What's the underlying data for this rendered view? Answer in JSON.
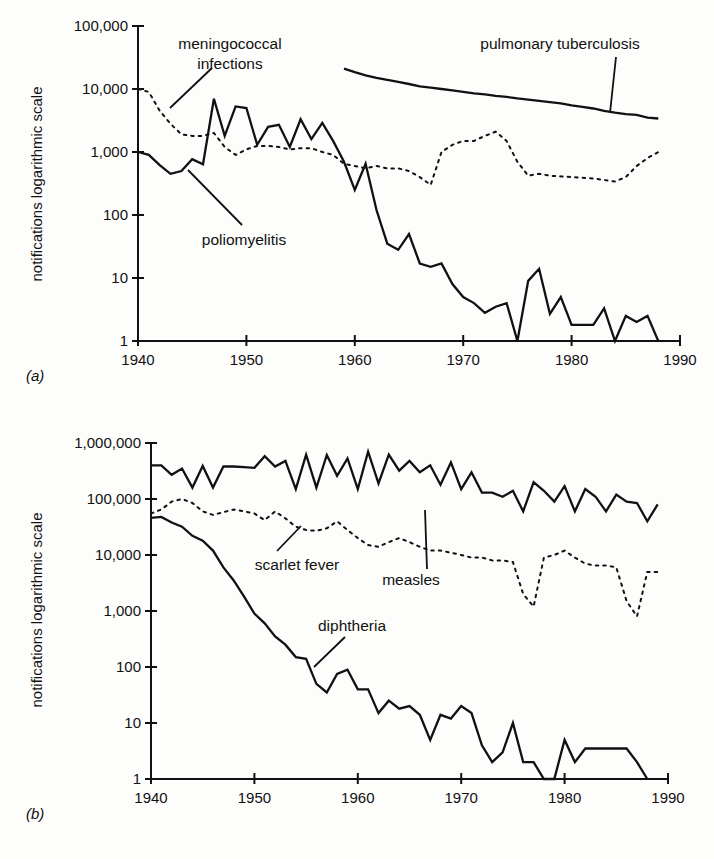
{
  "chart_data": [
    {
      "panel": "(a)",
      "type": "line",
      "title": "",
      "xlabel": "",
      "ylabel": "notifications logarithmic scale",
      "yscale": "log",
      "ylim": [
        1,
        100000
      ],
      "xlim": [
        1940,
        1990
      ],
      "xticks": [
        1940,
        1950,
        1960,
        1970,
        1980,
        1990
      ],
      "xtick_labels": [
        "1940",
        "1950",
        "1960",
        "1970",
        "1980",
        "1990"
      ],
      "yticks": [
        1,
        10,
        100,
        1000,
        10000,
        100000
      ],
      "ytick_labels": [
        "1",
        "10",
        "100",
        "1,000",
        "10,000",
        "100,000"
      ],
      "grid": false,
      "legend": "inline labels with leader lines",
      "series": [
        {
          "name": "poliomyelitis",
          "style": "solid",
          "x": [
            1940,
            1941,
            1942,
            1943,
            1944,
            1945,
            1946,
            1947,
            1948,
            1949,
            1950,
            1951,
            1952,
            1953,
            1954,
            1955,
            1956,
            1957,
            1958,
            1959,
            1960,
            1961,
            1962,
            1963,
            1964,
            1965,
            1966,
            1967,
            1968,
            1969,
            1970,
            1971,
            1972,
            1973,
            1974,
            1975,
            1976,
            1977,
            1978,
            1979,
            1980,
            1981,
            1982,
            1983,
            1984,
            1985,
            1986,
            1987,
            1988
          ],
          "values": [
            1000,
            900,
            620,
            450,
            500,
            770,
            640,
            7000,
            1800,
            5300,
            5000,
            1300,
            2500,
            2700,
            1200,
            3300,
            1600,
            2900,
            1500,
            700,
            250,
            650,
            120,
            35,
            28,
            50,
            17,
            15,
            17,
            8,
            5,
            4,
            2.8,
            3.5,
            4,
            1,
            9,
            14,
            2.7,
            5,
            1.8,
            1.8,
            1.8,
            3.3,
            1,
            2.5,
            2,
            2.5,
            1
          ]
        },
        {
          "name": "meningococcal infections",
          "style": "dotted",
          "x": [
            1940,
            1941,
            1942,
            1943,
            1944,
            1945,
            1946,
            1947,
            1948,
            1949,
            1950,
            1951,
            1952,
            1953,
            1954,
            1955,
            1956,
            1957,
            1958,
            1959,
            1960,
            1961,
            1962,
            1963,
            1964,
            1965,
            1966,
            1967,
            1968,
            1969,
            1970,
            1971,
            1972,
            1973,
            1974,
            1975,
            1976,
            1977,
            1978,
            1979,
            1980,
            1981,
            1982,
            1983,
            1984,
            1985,
            1986,
            1987,
            1988
          ],
          "values": [
            10000,
            9000,
            4500,
            2800,
            1900,
            1800,
            1800,
            2000,
            1200,
            900,
            1100,
            1250,
            1250,
            1200,
            1100,
            1150,
            1150,
            1000,
            900,
            650,
            600,
            550,
            600,
            550,
            550,
            500,
            400,
            300,
            1000,
            1300,
            1500,
            1500,
            1800,
            2100,
            1500,
            700,
            420,
            450,
            420,
            410,
            400,
            390,
            380,
            360,
            340,
            400,
            600,
            800,
            1000
          ]
        },
        {
          "name": "pulmonary tuberculosis",
          "style": "solid",
          "x": [
            1959,
            1960,
            1961,
            1962,
            1963,
            1964,
            1965,
            1966,
            1967,
            1968,
            1969,
            1970,
            1971,
            1972,
            1973,
            1974,
            1975,
            1976,
            1977,
            1978,
            1979,
            1980,
            1981,
            1982,
            1983,
            1984,
            1985,
            1986,
            1987,
            1988
          ],
          "values": [
            21000,
            18500,
            16500,
            15000,
            14000,
            13000,
            12000,
            11000,
            10500,
            10000,
            9500,
            9000,
            8500,
            8200,
            7800,
            7500,
            7100,
            6800,
            6500,
            6200,
            5900,
            5500,
            5200,
            4900,
            4500,
            4200,
            4000,
            3900,
            3500,
            3400
          ]
        }
      ],
      "annotations": [
        "meningococcal infections",
        "pulmonary tuberculosis",
        "poliomyelitis"
      ]
    },
    {
      "panel": "(b)",
      "type": "line",
      "title": "",
      "xlabel": "",
      "ylabel": "notifications logarithmic scale",
      "yscale": "log",
      "ylim": [
        1,
        1000000
      ],
      "xlim": [
        1940,
        1990
      ],
      "xticks": [
        1940,
        1950,
        1960,
        1970,
        1980,
        1990
      ],
      "xtick_labels": [
        "1940",
        "1950",
        "1960",
        "1970",
        "1980",
        "1990"
      ],
      "yticks": [
        1,
        10,
        100,
        1000,
        10000,
        100000,
        1000000
      ],
      "ytick_labels": [
        "1",
        "10",
        "100",
        "1,000",
        "10,000",
        "100,000",
        "1,000,000"
      ],
      "grid": false,
      "legend": "inline labels with leader lines",
      "series": [
        {
          "name": "measles",
          "style": "solid",
          "x": [
            1940,
            1941,
            1942,
            1943,
            1944,
            1945,
            1946,
            1947,
            1948,
            1949,
            1950,
            1951,
            1952,
            1953,
            1954,
            1955,
            1956,
            1957,
            1958,
            1959,
            1960,
            1961,
            1962,
            1963,
            1964,
            1965,
            1966,
            1967,
            1968,
            1969,
            1970,
            1971,
            1972,
            1973,
            1974,
            1975,
            1976,
            1977,
            1978,
            1979,
            1980,
            1981,
            1982,
            1983,
            1984,
            1985,
            1986,
            1987,
            1988,
            1989
          ],
          "values": [
            400000,
            400000,
            270000,
            350000,
            160000,
            390000,
            160000,
            380000,
            380000,
            370000,
            360000,
            580000,
            380000,
            480000,
            150000,
            620000,
            160000,
            610000,
            260000,
            530000,
            150000,
            700000,
            190000,
            620000,
            320000,
            480000,
            300000,
            400000,
            180000,
            450000,
            150000,
            300000,
            130000,
            130000,
            110000,
            140000,
            60000,
            200000,
            140000,
            90000,
            170000,
            60000,
            150000,
            110000,
            60000,
            120000,
            90000,
            85000,
            40000,
            80000
          ]
        },
        {
          "name": "scarlet fever",
          "style": "dotted",
          "x": [
            1940,
            1941,
            1942,
            1943,
            1944,
            1945,
            1946,
            1947,
            1948,
            1949,
            1950,
            1951,
            1952,
            1953,
            1954,
            1955,
            1956,
            1957,
            1958,
            1959,
            1960,
            1961,
            1962,
            1963,
            1964,
            1965,
            1966,
            1967,
            1968,
            1969,
            1970,
            1971,
            1972,
            1973,
            1974,
            1975,
            1976,
            1977,
            1978,
            1979,
            1980,
            1981,
            1982,
            1983,
            1984,
            1985,
            1986,
            1987,
            1988,
            1989
          ],
          "values": [
            55000,
            65000,
            90000,
            100000,
            85000,
            60000,
            52000,
            58000,
            65000,
            60000,
            55000,
            42000,
            60000,
            45000,
            32000,
            28000,
            27000,
            30000,
            40000,
            28000,
            20000,
            15000,
            14000,
            17000,
            20000,
            17000,
            14000,
            12000,
            12000,
            11000,
            10000,
            9000,
            9000,
            8000,
            8000,
            7500,
            2000,
            1200,
            9000,
            10000,
            12000,
            9000,
            7000,
            6500,
            6500,
            6000,
            1500,
            800,
            5000,
            5000
          ]
        },
        {
          "name": "diphtheria",
          "style": "solid",
          "x": [
            1940,
            1941,
            1942,
            1943,
            1944,
            1945,
            1946,
            1947,
            1948,
            1949,
            1950,
            1951,
            1952,
            1953,
            1954,
            1955,
            1956,
            1957,
            1958,
            1959,
            1960,
            1961,
            1962,
            1963,
            1964,
            1965,
            1966,
            1967,
            1968,
            1969,
            1970,
            1971,
            1972,
            1973,
            1974,
            1975,
            1976,
            1977,
            1978,
            1979,
            1980,
            1981,
            1982,
            1983,
            1984,
            1985,
            1986,
            1987,
            1988
          ],
          "values": [
            46000,
            48000,
            38000,
            32000,
            22000,
            18000,
            12000,
            6000,
            3500,
            1800,
            900,
            600,
            350,
            250,
            150,
            140,
            50,
            35,
            75,
            90,
            40,
            40,
            15,
            25,
            18,
            20,
            14,
            5,
            14,
            12,
            20,
            15,
            4,
            2,
            3,
            10,
            2,
            2,
            1,
            1,
            5,
            2,
            3.5,
            3.5,
            3.5,
            3.5,
            3.5,
            2,
            1
          ]
        }
      ],
      "annotations": [
        "measles",
        "scarlet fever",
        "diphtheria"
      ]
    }
  ],
  "labels": {
    "panel_a": "(a)",
    "panel_b": "(b)",
    "ylabel": "notifications logarithmic scale",
    "meningococcal_line1": "meningococcal",
    "meningococcal_line2": "infections",
    "tuberculosis": "pulmonary tuberculosis",
    "polio": "poliomyelitis",
    "measles": "measles",
    "scarlet": "scarlet fever",
    "diphtheria": "diphtheria"
  }
}
